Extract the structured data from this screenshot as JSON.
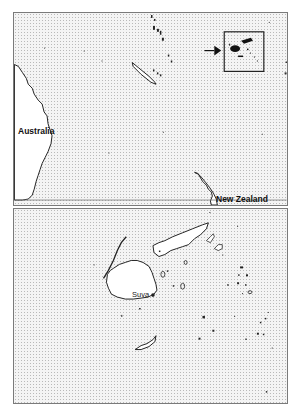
{
  "map": {
    "overview": {
      "labels": {
        "australia": "Australia",
        "new_zealand": "New Zealand"
      },
      "inset_indicator": "arrow-to-fiji-box"
    },
    "detail": {
      "labels": {
        "capital": "Suva"
      },
      "region": "Fiji"
    },
    "colors": {
      "land": "#ffffff",
      "sea": "#f4f4f4",
      "outline": "#222222",
      "frame": "#7a7a7a"
    }
  }
}
